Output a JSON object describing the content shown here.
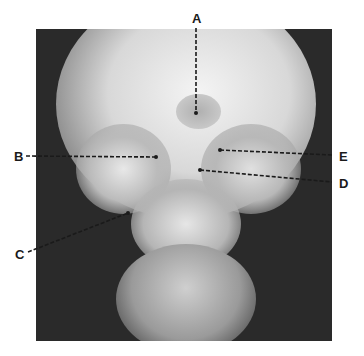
{
  "figure": {
    "labels": [
      {
        "id": "A",
        "text": "A",
        "label_x": 196,
        "label_y": 19,
        "line": [
          196,
          28,
          196,
          113
        ]
      },
      {
        "id": "B",
        "text": "B",
        "label_x": 19,
        "label_y": 156,
        "line": [
          26,
          156,
          156,
          157
        ]
      },
      {
        "id": "C",
        "text": "C",
        "label_x": 20,
        "label_y": 254,
        "line": [
          28,
          252,
          128,
          213
        ]
      },
      {
        "id": "D",
        "text": "D",
        "label_x": 345,
        "label_y": 183,
        "line": [
          200,
          170,
          332,
          182
        ]
      },
      {
        "id": "E",
        "text": "E",
        "label_x": 345,
        "label_y": 156,
        "line": [
          220,
          150,
          332,
          155
        ]
      }
    ]
  }
}
